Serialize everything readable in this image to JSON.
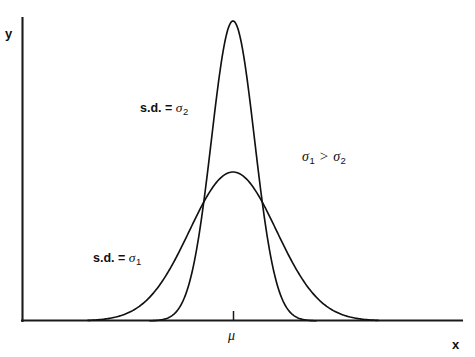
{
  "figure": {
    "name": "normal-distribution-comparison",
    "background_color": "#ffffff",
    "line_color": "#111111"
  },
  "axes": {
    "x_label": "x",
    "y_label": "y",
    "mean_tick_label": "μ",
    "origin": [
      22,
      321
    ],
    "x_axis_end": [
      462,
      321
    ],
    "y_axis_top": [
      22,
      18
    ]
  },
  "annotations": {
    "curve_wide_label_prefix": "s.d. = ",
    "curve_wide_symbol": "σ",
    "curve_wide_subscript": "1",
    "curve_narrow_label_prefix": "s.d. = ",
    "curve_narrow_symbol": "σ",
    "curve_narrow_subscript": "2",
    "inequality_left_symbol": "σ",
    "inequality_left_subscript": "1",
    "inequality_operator": ">",
    "inequality_right_symbol": "σ",
    "inequality_right_subscript": "2"
  },
  "chart_data": {
    "type": "line",
    "title": "",
    "xlabel": "x",
    "ylabel": "y",
    "grid": false,
    "legend": "inline-annotations",
    "xlim": [
      22,
      462
    ],
    "ylim": [
      321,
      18
    ],
    "mean_x": 233,
    "baseline_y": 321,
    "series": [
      {
        "name": "s.d. = σ₂",
        "description": "narrow tall normal curve, small standard deviation",
        "peak_x": 233,
        "peak_y": 21,
        "peak_height": 300,
        "sigma_px": 21.5,
        "left_tail_x": 150,
        "right_tail_x": 316
      },
      {
        "name": "s.d. = σ₁",
        "description": "wide flat normal curve, large standard deviation",
        "peak_x": 233,
        "peak_y": 172,
        "peak_height": 149,
        "sigma_px": 43.5,
        "left_tail_x": 88,
        "right_tail_x": 378
      }
    ],
    "crossover_points": [
      {
        "x": 197,
        "y": 197
      },
      {
        "x": 262,
        "y": 197
      }
    ],
    "annotations": [
      {
        "text": "s.d. = σ₂",
        "x": 140,
        "y": 101
      },
      {
        "text": "s.d. = σ₁",
        "x": 93,
        "y": 251
      },
      {
        "text": "σ₁ > σ₂",
        "x": 302,
        "y": 149
      },
      {
        "text": "μ",
        "x": 228,
        "y": 329
      }
    ]
  }
}
